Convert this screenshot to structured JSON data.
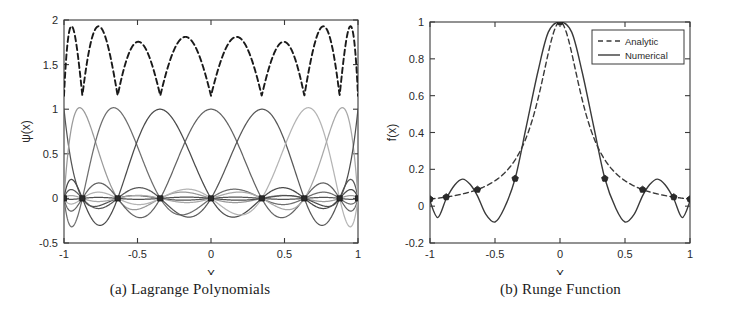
{
  "figure": {
    "background": "#ffffff",
    "ink": "#2a2a2a"
  },
  "panels": [
    {
      "id": "a",
      "caption": "(a) Lagrange Polynomials"
    },
    {
      "id": "b",
      "caption": "(b) Runge Function"
    }
  ],
  "chart_data": [
    {
      "type": "line",
      "id": "lagrange-polynomials",
      "title": "(a) Lagrange Polynomials",
      "xlabel": "X",
      "ylabel": "ψ(x)",
      "xlim": [
        -1,
        1
      ],
      "ylim": [
        -0.5,
        2
      ],
      "xticks": [
        -1,
        -0.5,
        0,
        0.5,
        1
      ],
      "xticklabels": [
        "-1",
        "-0.5",
        "0",
        "0.5",
        "1"
      ],
      "yticks": [
        -0.5,
        0,
        0.5,
        1,
        1.5,
        2
      ],
      "yticklabels": [
        "-0.5",
        "0",
        "0.5",
        "1",
        "1.5",
        "2"
      ],
      "grid": false,
      "legend": null,
      "nodes": {
        "name": "interpolation-nodes",
        "description": "Chebyshev-Gauss-Lobatto points, N=8",
        "x": [
          -1,
          -0.9239,
          -0.7071,
          -0.3827,
          0,
          0.3827,
          0.7071,
          0.9239,
          1
        ],
        "x_plotted": [
          -1,
          -0.875,
          -0.635,
          -0.345,
          0,
          0.345,
          0.635,
          0.875,
          1
        ],
        "y": [
          0,
          0,
          0,
          0,
          0,
          0,
          0,
          0,
          0
        ],
        "marker": "square",
        "color": "#2b2b2b"
      },
      "series": [
        {
          "name": "psi_0",
          "peak_x": -1.0,
          "peak_y": 1.0,
          "color": "#555555",
          "style": "solid"
        },
        {
          "name": "psi_1",
          "peak_x": -0.875,
          "peak_y": 1.0,
          "color": "#9a9a9a",
          "style": "solid"
        },
        {
          "name": "psi_2",
          "peak_x": -0.635,
          "peak_y": 1.0,
          "color": "#6e6e6e",
          "style": "solid"
        },
        {
          "name": "psi_3",
          "peak_x": -0.345,
          "peak_y": 1.0,
          "color": "#4a4a4a",
          "style": "solid"
        },
        {
          "name": "psi_4",
          "peak_x": 0.0,
          "peak_y": 1.0,
          "color": "#636363",
          "style": "solid"
        },
        {
          "name": "psi_5",
          "peak_x": 0.345,
          "peak_y": 1.0,
          "color": "#585858",
          "style": "solid"
        },
        {
          "name": "psi_6",
          "peak_x": 0.635,
          "peak_y": 1.0,
          "color": "#b4b4b4",
          "style": "solid"
        },
        {
          "name": "psi_7",
          "peak_x": 0.875,
          "peak_y": 1.0,
          "color": "#a8a8a8",
          "style": "solid"
        },
        {
          "name": "psi_8",
          "peak_x": 1.0,
          "peak_y": 1.0,
          "color": "#4f4f4f",
          "style": "solid"
        }
      ],
      "lebesgue": {
        "name": "lebesgue-function",
        "style": "dashed",
        "color": "#1a1a1a",
        "min": 1.15,
        "max": 1.93,
        "lobes": 8
      }
    },
    {
      "type": "line",
      "id": "runge-function",
      "title": "(b) Runge Function",
      "xlabel": "X",
      "ylabel": "f(x)",
      "xlim": [
        -1,
        1
      ],
      "ylim": [
        -0.2,
        1
      ],
      "xticks": [
        -1,
        -0.5,
        0,
        0.5,
        1
      ],
      "xticklabels": [
        "-1",
        "-0.5",
        "0",
        "0.5",
        "1"
      ],
      "yticks": [
        -0.2,
        0,
        0.2,
        0.4,
        0.6,
        0.8,
        1
      ],
      "yticklabels": [
        "-0.2",
        "0",
        "0.2",
        "0.4",
        "0.6",
        "0.8",
        "1"
      ],
      "grid": false,
      "legend": {
        "position": "top-right",
        "entries": [
          {
            "label": "Analytic",
            "style": "dashed",
            "color": "#3a3a3a"
          },
          {
            "label": "Numerical",
            "style": "solid",
            "color": "#3a3a3a"
          }
        ]
      },
      "series": [
        {
          "name": "Analytic",
          "style": "dashed",
          "color": "#3a3a3a",
          "formula": "1/(1+25x^2)",
          "x": [
            -1,
            -0.875,
            -0.75,
            -0.635,
            -0.5,
            -0.345,
            -0.2,
            -0.1,
            0,
            0.1,
            0.2,
            0.345,
            0.5,
            0.635,
            0.75,
            0.875,
            1
          ],
          "y": [
            0.0385,
            0.0496,
            0.0664,
            0.0903,
            0.1379,
            0.2516,
            0.5,
            0.8,
            1.0,
            0.8,
            0.5,
            0.2516,
            0.1379,
            0.0903,
            0.0664,
            0.0496,
            0.0385
          ]
        },
        {
          "name": "Numerical",
          "style": "solid",
          "color": "#3a3a3a",
          "description": "Polynomial interpolant through the nodes, showing Runge oscillations",
          "x": [
            -1,
            -0.94,
            -0.875,
            -0.81,
            -0.75,
            -0.69,
            -0.635,
            -0.57,
            -0.5,
            -0.43,
            -0.345,
            -0.26,
            -0.17,
            -0.09,
            0,
            0.09,
            0.17,
            0.26,
            0.345,
            0.43,
            0.5,
            0.57,
            0.635,
            0.69,
            0.75,
            0.81,
            0.875,
            0.94,
            1
          ],
          "y": [
            0.027,
            -0.062,
            0.04,
            0.115,
            0.147,
            0.118,
            0.056,
            -0.045,
            -0.086,
            -0.013,
            0.15,
            0.43,
            0.73,
            0.945,
            1.0,
            0.945,
            0.73,
            0.43,
            0.15,
            -0.013,
            -0.086,
            -0.045,
            0.056,
            0.118,
            0.147,
            0.115,
            0.04,
            -0.062,
            0.027
          ]
        }
      ],
      "nodes": {
        "name": "interpolation-nodes",
        "x": [
          -1,
          -0.875,
          -0.635,
          -0.345,
          0,
          0.345,
          0.635,
          0.875,
          1
        ],
        "y": [
          0.0385,
          0.0496,
          0.0903,
          0.15,
          1.0,
          0.15,
          0.0903,
          0.0496,
          0.0385
        ],
        "marker": "pentagon",
        "color": "#2b2b2b"
      }
    }
  ]
}
